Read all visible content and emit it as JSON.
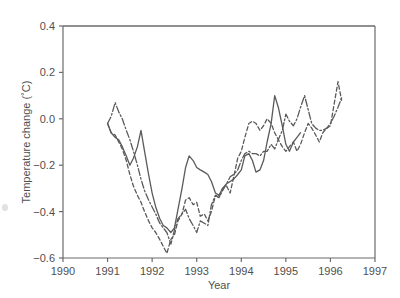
{
  "figure": {
    "background_color": "#ffffff",
    "line_color": "#5a5a5a",
    "axis_color": "#6b6b6b"
  },
  "chart_data": {
    "type": "line",
    "title": "",
    "subtitle": "",
    "xlabel": "Year",
    "ylabel": "Temperature change (˚C)",
    "xlim": [
      1990,
      1997
    ],
    "ylim": [
      -0.6,
      0.4
    ],
    "grid": false,
    "legend": "none",
    "x_ticks": [
      1990,
      1991,
      1992,
      1993,
      1994,
      1995,
      1996,
      1997
    ],
    "x_tick_labels": [
      "1990",
      "1991",
      "1992",
      "1993",
      "1994",
      "1995",
      "1996",
      "1997"
    ],
    "y_ticks": [
      -0.6,
      -0.4,
      -0.2,
      0.0,
      0.2,
      0.4
    ],
    "y_tick_labels": [
      "−0.6",
      "−0.4",
      "−0.2",
      "0.0",
      "0.2",
      "0.4"
    ],
    "annotations": [],
    "series": [
      {
        "name": "series-solid",
        "style": "solid",
        "color": "#5a5a5a",
        "x": [
          1991.0,
          1991.08,
          1991.17,
          1991.25,
          1991.33,
          1991.42,
          1991.5,
          1991.58,
          1991.67,
          1991.75,
          1991.83,
          1991.92,
          1992.0,
          1992.08,
          1992.17,
          1992.25,
          1992.33,
          1992.42,
          1992.5,
          1992.58,
          1992.67,
          1992.75,
          1992.83,
          1992.92,
          1993.0,
          1993.08,
          1993.17,
          1993.25,
          1993.33,
          1993.42,
          1993.5,
          1993.58,
          1993.67,
          1993.75,
          1993.83,
          1993.92,
          1994.0,
          1994.08,
          1994.17,
          1994.25,
          1994.33,
          1994.42,
          1994.5,
          1994.58,
          1994.67,
          1994.75,
          1994.83,
          1994.92,
          1995.0,
          1995.08,
          1995.17,
          1995.25,
          1995.33
        ],
        "y": [
          -0.02,
          -0.06,
          -0.08,
          -0.09,
          -0.12,
          -0.16,
          -0.2,
          -0.17,
          -0.12,
          -0.05,
          -0.14,
          -0.24,
          -0.32,
          -0.38,
          -0.43,
          -0.46,
          -0.47,
          -0.49,
          -0.47,
          -0.39,
          -0.3,
          -0.21,
          -0.16,
          -0.18,
          -0.21,
          -0.22,
          -0.23,
          -0.24,
          -0.27,
          -0.32,
          -0.33,
          -0.3,
          -0.28,
          -0.27,
          -0.26,
          -0.24,
          -0.22,
          -0.16,
          -0.15,
          -0.18,
          -0.23,
          -0.22,
          -0.18,
          -0.1,
          -0.02,
          0.1,
          0.05,
          -0.03,
          -0.11,
          -0.14,
          -0.1,
          -0.08,
          -0.06
        ]
      },
      {
        "name": "series-dashed",
        "style": "dashed",
        "color": "#5a5a5a",
        "x": [
          1991.0,
          1991.08,
          1991.17,
          1991.25,
          1991.33,
          1991.42,
          1991.5,
          1991.58,
          1991.67,
          1991.75,
          1991.83,
          1991.92,
          1992.0,
          1992.08,
          1992.17,
          1992.25,
          1992.33,
          1992.42,
          1992.5,
          1992.58,
          1992.67,
          1992.75,
          1992.83,
          1992.92,
          1993.0,
          1993.08,
          1993.17,
          1993.25,
          1993.33,
          1993.42,
          1993.5,
          1993.58,
          1993.67,
          1993.75,
          1993.83,
          1993.92,
          1994.0,
          1994.08,
          1994.17,
          1994.25,
          1994.33,
          1994.42,
          1994.5,
          1994.58,
          1994.67,
          1994.75,
          1994.83,
          1994.92,
          1995.0,
          1995.08,
          1995.17,
          1995.25,
          1995.33,
          1995.42,
          1995.5,
          1995.58,
          1995.67,
          1995.75,
          1995.83,
          1995.92,
          1996.0,
          1996.08,
          1996.17,
          1996.25
        ],
        "y": [
          -0.02,
          -0.06,
          -0.07,
          -0.1,
          -0.13,
          -0.18,
          -0.24,
          -0.29,
          -0.33,
          -0.36,
          -0.4,
          -0.44,
          -0.47,
          -0.49,
          -0.52,
          -0.55,
          -0.58,
          -0.52,
          -0.5,
          -0.44,
          -0.41,
          -0.35,
          -0.34,
          -0.37,
          -0.36,
          -0.42,
          -0.41,
          -0.44,
          -0.4,
          -0.33,
          -0.34,
          -0.3,
          -0.29,
          -0.32,
          -0.25,
          -0.17,
          -0.14,
          -0.08,
          -0.02,
          -0.01,
          -0.02,
          -0.05,
          -0.03,
          0.0,
          -0.02,
          -0.06,
          -0.09,
          -0.12,
          -0.14,
          -0.12,
          -0.1,
          -0.14,
          -0.11,
          -0.06,
          -0.02,
          -0.04,
          -0.07,
          -0.1,
          -0.06,
          -0.04,
          -0.03,
          0.06,
          0.16,
          0.08
        ]
      },
      {
        "name": "series-dash-dot",
        "style": "dash-dot",
        "color": "#5a5a5a",
        "x": [
          1991.0,
          1991.08,
          1991.17,
          1991.25,
          1991.33,
          1991.42,
          1991.5,
          1991.58,
          1991.67,
          1991.75,
          1991.83,
          1991.92,
          1992.0,
          1992.08,
          1992.17,
          1992.25,
          1992.33,
          1992.42,
          1992.5,
          1992.58,
          1992.67,
          1992.75,
          1992.83,
          1992.92,
          1993.0,
          1993.08,
          1993.17,
          1993.25,
          1993.33,
          1993.42,
          1993.5,
          1993.58,
          1993.67,
          1993.75,
          1993.83,
          1993.92,
          1994.0,
          1994.08,
          1994.17,
          1994.25,
          1994.33,
          1994.42,
          1994.5,
          1994.58,
          1994.67,
          1994.75,
          1994.83,
          1994.92,
          1995.0,
          1995.08,
          1995.17,
          1995.25,
          1995.33,
          1995.42,
          1995.5,
          1995.58,
          1995.67,
          1995.75,
          1995.83,
          1995.92,
          1996.0,
          1996.08,
          1996.17,
          1996.25
        ],
        "y": [
          -0.02,
          0.01,
          0.07,
          0.03,
          0.0,
          -0.05,
          -0.09,
          -0.14,
          -0.2,
          -0.26,
          -0.31,
          -0.35,
          -0.38,
          -0.41,
          -0.45,
          -0.47,
          -0.49,
          -0.54,
          -0.48,
          -0.43,
          -0.41,
          -0.39,
          -0.43,
          -0.46,
          -0.49,
          -0.44,
          -0.45,
          -0.46,
          -0.37,
          -0.33,
          -0.34,
          -0.31,
          -0.28,
          -0.25,
          -0.24,
          -0.22,
          -0.18,
          -0.15,
          -0.14,
          -0.15,
          -0.15,
          -0.16,
          -0.14,
          -0.14,
          -0.11,
          -0.13,
          -0.09,
          -0.05,
          0.02,
          -0.01,
          -0.03,
          0.0,
          0.05,
          0.1,
          0.04,
          -0.02,
          -0.04,
          -0.05,
          -0.05,
          -0.04,
          -0.02,
          0.01,
          0.05,
          0.09
        ]
      }
    ]
  }
}
